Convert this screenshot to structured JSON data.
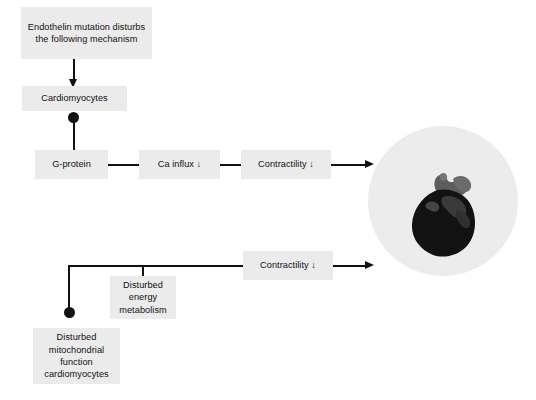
{
  "figure": {
    "background_color": "#ffffff",
    "node_fill_color": "#ebebeb",
    "line_color": "#111111",
    "circle_fill_color": "#ececec",
    "heart_color": "#121212"
  },
  "nodes": {
    "trigger": {
      "label": "Endothelin mutation disturbs the following mechanism"
    },
    "cardiomyocytes": {
      "label": "Cardiomyocytes"
    },
    "g_protein": {
      "label": "G-protein"
    },
    "ca_influx": {
      "label": "Ca influx ↓"
    },
    "contractility_top": {
      "label": "Contractility ↓"
    },
    "contractility_bottom": {
      "label": "Contractility ↓"
    },
    "disturbed_energy": {
      "label": "Disturbed energy metabolism"
    },
    "disturbed_mitochondria": {
      "label": "Disturbed mitochondrial function cardiomyocytes"
    }
  },
  "illustration": {
    "heart_label": "heart-illustration",
    "circle_label": "circular-photo-background"
  }
}
